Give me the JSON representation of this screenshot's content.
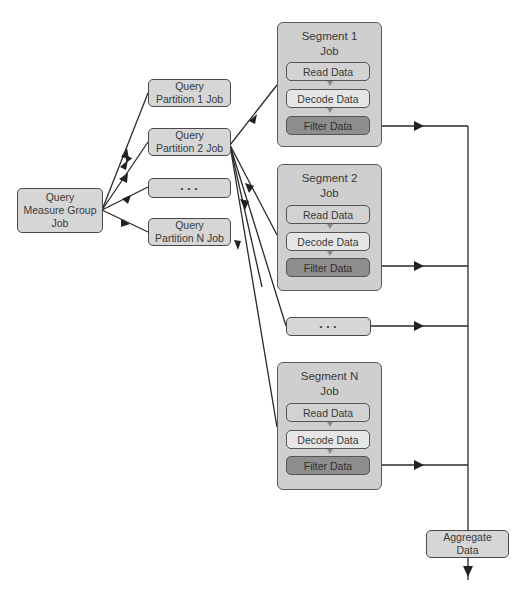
{
  "diagram": {
    "root": {
      "label_line1": "Query",
      "label_line2": "Measure Group",
      "label_line3": "Job"
    },
    "partitions": [
      {
        "line1": "Query",
        "line2": "Partition 1 Job"
      },
      {
        "line1": "Query",
        "line2": "Partition 2 Job"
      },
      {
        "line1": "• • •",
        "line2": ""
      },
      {
        "line1": "Query",
        "line2": "Partition N Job"
      }
    ],
    "segments": [
      {
        "title_line1": "Segment 1",
        "title_line2": "Job",
        "steps": [
          "Read Data",
          "Decode Data",
          "Filter Data"
        ]
      },
      {
        "title_line1": "Segment 2",
        "title_line2": "Job",
        "steps": [
          "Read Data",
          "Decode Data",
          "Filter Data"
        ]
      },
      {
        "title_line1": "Segment N",
        "title_line2": "Job",
        "steps": [
          "Read Data",
          "Decode Data",
          "Filter Data"
        ]
      }
    ],
    "segment_ellipsis": "• • •",
    "aggregate": {
      "line1": "Aggregate",
      "line2": "Data"
    },
    "colors": {
      "box_fill": "#d6d6d6",
      "segment_fill": "#cfcfcf",
      "read_fill": "#d2d2d2",
      "decode_fill": "#e6e6e6",
      "filter_fill": "#8e8e8e",
      "line": "#2a2a2a"
    }
  }
}
